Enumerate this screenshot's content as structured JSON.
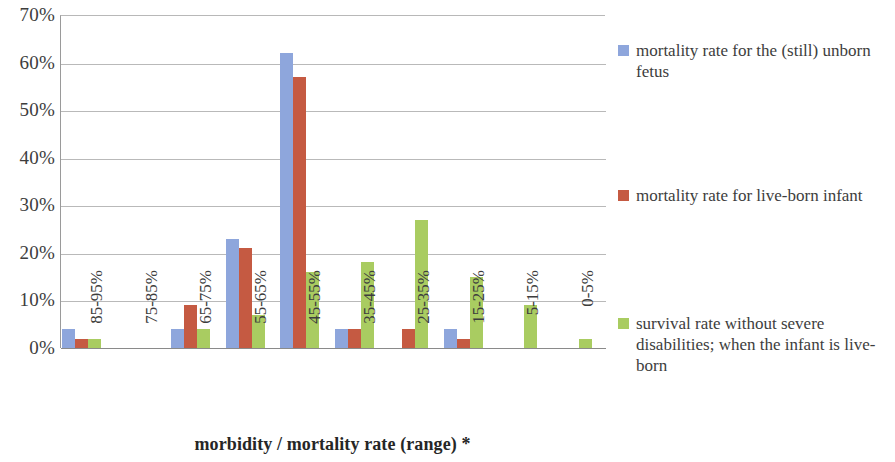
{
  "chart_data": {
    "type": "bar",
    "title": "",
    "subtitle": "",
    "xlabel": "morbidity / mortality rate (range) *",
    "ylabel": "",
    "ylim": [
      0,
      70
    ],
    "ytick_labels": [
      "70%",
      "60%",
      "50%",
      "40%",
      "30%",
      "20%",
      "10%",
      "0%"
    ],
    "ytick_values": [
      70,
      60,
      50,
      40,
      30,
      20,
      10,
      0
    ],
    "grid": true,
    "legend_position": "right",
    "categories": [
      "85-95%",
      "75-85%",
      "65-75%",
      "55-65%",
      "45-55%",
      "35-45%",
      "25-35%",
      "15-25%",
      "5-15%",
      "0-5%"
    ],
    "series": [
      {
        "name": "mortality rate for the (still) unborn fetus",
        "color": "#8ea6dc",
        "values": [
          4,
          0,
          4,
          23,
          62,
          4,
          0,
          4,
          0,
          0
        ]
      },
      {
        "name": "mortality rate for live-born infant",
        "color": "#c55a42",
        "values": [
          2,
          0,
          9,
          21,
          57,
          4,
          4,
          2,
          0,
          0
        ]
      },
      {
        "name": "survival rate without severe disabilities; when the infant is live-born",
        "color": "#a9cc61",
        "values": [
          2,
          0,
          4,
          7,
          16,
          18,
          27,
          15,
          9,
          2
        ]
      }
    ]
  },
  "legend": {
    "items": [
      {
        "label": "mortality rate for the (still) unborn fetus",
        "color": "#8ea6dc"
      },
      {
        "label": "mortality rate for live-born infant",
        "color": "#c55a42"
      },
      {
        "label": "survival rate without severe disabilities; when the infant is live-born",
        "color": "#a9cc61"
      }
    ]
  }
}
